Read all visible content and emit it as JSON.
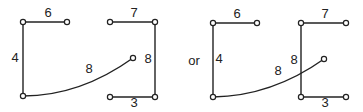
{
  "separator": "or",
  "diagrams": [
    {
      "name": "left-graph",
      "nodes": [
        {
          "id": "a",
          "x": 23,
          "y": 22
        },
        {
          "id": "b",
          "x": 67,
          "y": 22
        },
        {
          "id": "c",
          "x": 23,
          "y": 96
        },
        {
          "id": "d",
          "x": 133,
          "y": 58
        },
        {
          "id": "e",
          "x": 110,
          "y": 22
        },
        {
          "id": "f",
          "x": 155,
          "y": 22
        },
        {
          "id": "g",
          "x": 110,
          "y": 97
        },
        {
          "id": "h",
          "x": 155,
          "y": 97
        }
      ],
      "edges": [
        {
          "from": "a",
          "to": "b",
          "weight": "6",
          "lx": 48,
          "ly": 14
        },
        {
          "from": "a",
          "to": "c",
          "weight": "4",
          "lx": 15,
          "ly": 59
        },
        {
          "from": "c",
          "to": "d",
          "weight": "8",
          "lx": 89,
          "ly": 70,
          "curved": true
        },
        {
          "from": "e",
          "to": "f",
          "weight": "7",
          "lx": 134,
          "ly": 14
        },
        {
          "from": "f",
          "to": "h",
          "weight": "8",
          "lx": 148,
          "ly": 60
        },
        {
          "from": "g",
          "to": "h",
          "weight": "3",
          "lx": 134,
          "ly": 104
        }
      ]
    },
    {
      "name": "right-graph",
      "nodes": [
        {
          "id": "a",
          "x": 213,
          "y": 23
        },
        {
          "id": "b",
          "x": 257,
          "y": 23
        },
        {
          "id": "c",
          "x": 213,
          "y": 97
        },
        {
          "id": "d",
          "x": 324,
          "y": 59
        },
        {
          "id": "e",
          "x": 301,
          "y": 23
        },
        {
          "id": "f",
          "x": 346,
          "y": 23
        },
        {
          "id": "g",
          "x": 301,
          "y": 97
        },
        {
          "id": "h",
          "x": 346,
          "y": 97
        }
      ],
      "edges": [
        {
          "from": "a",
          "to": "b",
          "weight": "6",
          "lx": 237,
          "ly": 15
        },
        {
          "from": "a",
          "to": "c",
          "weight": "4",
          "lx": 219,
          "ly": 60
        },
        {
          "from": "c",
          "to": "d",
          "weight": "8",
          "lx": 278,
          "ly": 72,
          "curved": true
        },
        {
          "from": "e",
          "to": "f",
          "weight": "7",
          "lx": 325,
          "ly": 15
        },
        {
          "from": "e",
          "to": "g",
          "weight": "8",
          "lx": 294,
          "ly": 61
        },
        {
          "from": "g",
          "to": "h",
          "weight": "3",
          "lx": 325,
          "ly": 104
        }
      ]
    }
  ]
}
